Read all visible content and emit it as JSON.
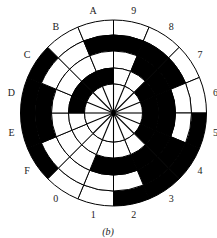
{
  "figure": {
    "caption": "(b)",
    "colors": {
      "mark": "#000000",
      "space": "#ffffff",
      "line": "#000000"
    }
  },
  "disc": {
    "center": [
      113.5,
      113
    ],
    "radii": [
      29,
      45,
      62,
      78,
      93
    ],
    "sector_count": 16,
    "sector_labels_clockwise_from_top": [
      "9",
      "8",
      "7",
      "6",
      "5",
      "4",
      "3",
      "2",
      "1",
      "0",
      "F",
      "E",
      "D",
      "C",
      "B",
      "A"
    ],
    "label_radius": 104,
    "rings_outer_to_inner": [
      {
        "name": "ring-1",
        "cells": [
          0,
          0,
          0,
          0,
          1,
          1,
          1,
          1,
          0,
          0,
          1,
          1,
          1,
          1,
          0,
          0
        ]
      },
      {
        "name": "ring-2",
        "cells": [
          1,
          1,
          1,
          0,
          0,
          1,
          1,
          0,
          0,
          0,
          0,
          1,
          1,
          0,
          0,
          1
        ]
      },
      {
        "name": "ring-3",
        "cells": [
          0,
          1,
          1,
          1,
          1,
          1,
          1,
          1,
          1,
          0,
          0,
          0,
          0,
          0,
          0,
          0
        ]
      },
      {
        "name": "ring-4",
        "cells": [
          0,
          0,
          1,
          1,
          1,
          1,
          0,
          0,
          0,
          0,
          0,
          0,
          1,
          1,
          1,
          1
        ]
      }
    ],
    "hub": {
      "spokes": 16,
      "fill": "#ffffff"
    }
  }
}
